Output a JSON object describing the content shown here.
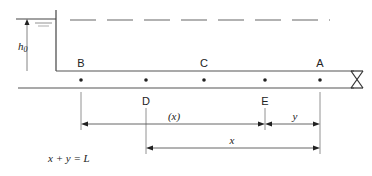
{
  "diagram": {
    "type": "pipeline-reservoir-valve",
    "reservoir": {
      "head_label": "h",
      "head_subscript": "0"
    },
    "points": [
      {
        "id": "B",
        "label": "B",
        "position": "top"
      },
      {
        "id": "D",
        "label": "D",
        "position": "bottom"
      },
      {
        "id": "C",
        "label": "C",
        "position": "top"
      },
      {
        "id": "E",
        "label": "E",
        "position": "bottom"
      },
      {
        "id": "A",
        "label": "A",
        "position": "top"
      }
    ],
    "dimensions": {
      "b_to_e_label": "(x)",
      "e_to_a_label": "y",
      "d_to_a_label": "x"
    },
    "equation": "x + y = L",
    "valve": {
      "symbol": "valve-icon"
    },
    "colors": {
      "line": "#555555",
      "text": "#222222",
      "background": "#ffffff"
    }
  }
}
